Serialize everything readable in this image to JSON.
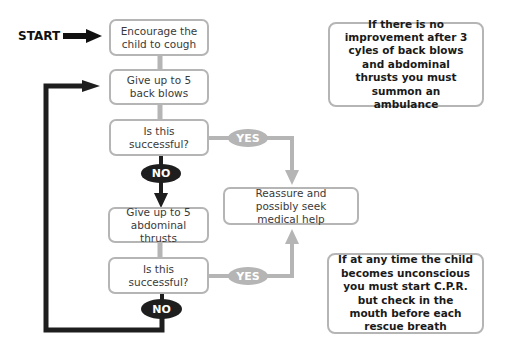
{
  "start_label": "START",
  "steps": [
    {
      "id": "encourage",
      "text": "Encourage the child to cough"
    },
    {
      "id": "back-blows",
      "text": "Give up to 5 back blows"
    },
    {
      "id": "check-1",
      "text": "Is this successful?"
    },
    {
      "id": "abdominal-thrusts",
      "text": "Give up to 5 abdominal thrusts"
    },
    {
      "id": "check-2",
      "text": "Is this successful?"
    },
    {
      "id": "reassure",
      "text": "Reassure and possibly seek medical help"
    }
  ],
  "decisions": {
    "yes_label": "YES",
    "no_label": "NO"
  },
  "notes": [
    {
      "id": "ambulance",
      "text": "If there is no improvement after 3 cyles of back blows and abdominal thrusts you must summon an ambulance"
    },
    {
      "id": "cpr",
      "text": "If at any time the child becomes unconscious you must start C.P.R. but check in the mouth before each rescue breath"
    }
  ],
  "colors": {
    "box_border": "#b5b5b5",
    "yes_connector": "#b5b5b5",
    "no_connector": "#1e1e1e",
    "text": "#3a3a3a"
  }
}
